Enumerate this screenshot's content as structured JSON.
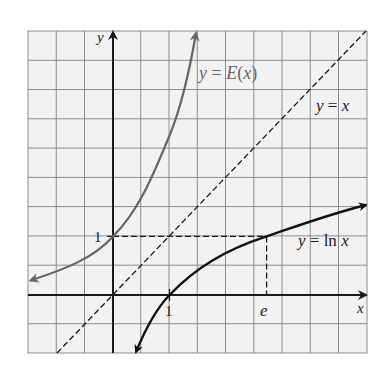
{
  "figure": {
    "type": "function-graph",
    "grid": {
      "x_min_units": -1.5,
      "x_max_units": 4.5,
      "y_min_units": -1,
      "y_max_units": 4.5,
      "cell_size_units": 0.5,
      "background": "#f2f2f2",
      "line_color": "#8c8c8c"
    },
    "axes": {
      "x_label": "x",
      "y_label": "y",
      "color": "#1a1a1a"
    },
    "ticks": {
      "x_one": "1",
      "y_one": "1",
      "x_e": "e"
    },
    "curves": [
      {
        "id": "exp",
        "label": "y = E(x)",
        "label_parts": [
          "y = ",
          "E",
          "(",
          "x",
          ")"
        ],
        "color": "#666666",
        "style": "solid"
      },
      {
        "id": "identity",
        "label": "y = x",
        "color": "#1a1a1a",
        "style": "dashed"
      },
      {
        "id": "ln",
        "label": "y = ln x",
        "color": "#111111",
        "style": "solid"
      }
    ],
    "guides": [
      {
        "id": "y-equals-1",
        "from": [
          0,
          1
        ],
        "to": [
          2.718,
          1
        ],
        "style": "dashed"
      },
      {
        "id": "x-equals-e",
        "from": [
          2.718,
          1
        ],
        "to": [
          2.718,
          0
        ],
        "style": "dashed"
      }
    ]
  },
  "labels": {
    "exp_y": "y",
    "exp_eq": " = ",
    "exp_E": "E",
    "exp_open": "(",
    "exp_x": "x",
    "exp_close": ")",
    "id_y": "y",
    "id_eq": " = ",
    "id_x": "x",
    "ln_y": "y",
    "ln_eq": " = ",
    "ln_fn": "ln",
    "ln_x": "x",
    "axis_x": "x",
    "axis_y": "y",
    "tick_x1": "1",
    "tick_y1": "1",
    "tick_e": "e"
  }
}
